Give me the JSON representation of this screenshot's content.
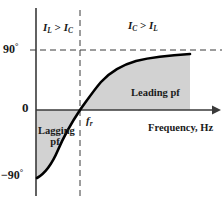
{
  "figure": {
    "kind": "phase-angle-vs-frequency-plot",
    "background": "#ffffff",
    "line_color": "#000000",
    "fill_color": "#d2d2d2",
    "axis_color": "#3a3a3a"
  },
  "axes": {
    "x_label": "Frequency, Hz",
    "y_ticks": [
      {
        "label": "90°",
        "value": 90
      },
      {
        "label": "0",
        "value": 0
      },
      {
        "label": "−90°",
        "value": -90
      }
    ],
    "x_marker_label_main": "f",
    "x_marker_label_sub": "r"
  },
  "regions": {
    "left": {
      "main": "I",
      "sub1": "L",
      "operator": " > ",
      "main2": "I",
      "sub2": "C"
    },
    "right": {
      "main": "I",
      "sub1": "C",
      "operator": " > ",
      "main2": "I",
      "sub2": "L"
    }
  },
  "annotations": {
    "lagging": "Lagging pf",
    "leading": "Leading pf"
  },
  "chart_data": {
    "type": "line",
    "title": "",
    "xlabel": "Frequency, Hz",
    "ylabel": "",
    "ylim": [
      -90,
      90
    ],
    "xlim": [
      0,
      1
    ],
    "grid": false,
    "legend": null,
    "x": [
      0.0,
      0.06,
      0.12,
      0.18,
      0.24,
      0.3,
      0.36,
      0.42,
      0.48,
      0.52,
      0.58,
      0.64,
      0.7,
      0.78,
      0.86,
      0.94,
      1.0
    ],
    "y": [
      -88,
      -86,
      -82,
      -76,
      -68,
      -56,
      -40,
      -22,
      -6,
      8,
      30,
      48,
      60,
      70,
      76,
      80,
      82
    ],
    "series": [
      {
        "name": "Phase angle",
        "values": [
          -88,
          -86,
          -82,
          -76,
          -68,
          -56,
          -40,
          -22,
          -6,
          8,
          30,
          48,
          60,
          70,
          76,
          80,
          82
        ]
      }
    ],
    "annotations": [
      {
        "text": "Lagging pf",
        "region": "below-zero-left-of-fr"
      },
      {
        "text": "Leading pf",
        "region": "above-zero-right-of-fr"
      },
      {
        "text": "I_L > I_C",
        "region": "upper-left"
      },
      {
        "text": "I_C > I_L",
        "region": "upper-right"
      },
      {
        "text": "f_r",
        "region": "x-axis-resonance-point"
      }
    ],
    "reference_lines": [
      {
        "orientation": "horizontal",
        "value": 90,
        "style": "dashed"
      },
      {
        "orientation": "vertical",
        "value": "f_r",
        "style": "dashed"
      }
    ]
  }
}
